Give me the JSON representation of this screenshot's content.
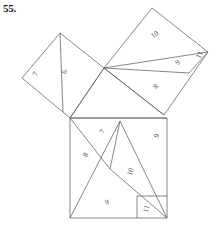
{
  "problem": {
    "number_label": "55."
  },
  "figure": {
    "type": "geometric-dissection-diagram",
    "stroke_color": "#5d5d63",
    "label_color": "#4a4a50",
    "background_color": "#ffffff"
  },
  "squares": {
    "left": {
      "name": "left-square",
      "pieces": [
        {
          "label": "7",
          "x": 36,
          "y": 74,
          "rotation": -65
        },
        {
          "label": "6",
          "x": 65,
          "y": 72,
          "rotation": -75
        }
      ]
    },
    "upper_right": {
      "name": "upper-right-square",
      "pieces": [
        {
          "label": "10",
          "x": 155,
          "y": 35,
          "rotation": -35
        },
        {
          "label": "9",
          "x": 178,
          "y": 63,
          "rotation": -40
        },
        {
          "label": "11",
          "x": 200,
          "y": 55,
          "rotation": -65
        },
        {
          "label": "8",
          "x": 156,
          "y": 87,
          "rotation": -40
        }
      ]
    },
    "bottom": {
      "name": "bottom-square",
      "pieces": [
        {
          "label": "7",
          "x": 103,
          "y": 132,
          "rotation": -55
        },
        {
          "label": "8",
          "x": 86,
          "y": 155,
          "rotation": -62
        },
        {
          "label": "9",
          "x": 157,
          "y": 136,
          "rotation": -62
        },
        {
          "label": "10",
          "x": 131,
          "y": 172,
          "rotation": -72
        },
        {
          "label": "9",
          "x": 107,
          "y": 203,
          "rotation": -12
        },
        {
          "label": "11",
          "x": 147,
          "y": 209,
          "rotation": -75
        }
      ]
    }
  },
  "geometry": {
    "central_triangle": {
      "name": "central-triangle",
      "vertices": [
        [
          104,
          68
        ],
        [
          70,
          118
        ],
        [
          139,
          118
        ]
      ]
    },
    "left_square_outline": [
      [
        70,
        118
      ],
      [
        22,
        78
      ],
      [
        60,
        33
      ],
      [
        104,
        68
      ]
    ],
    "upper_right_square_outline": [
      [
        104,
        68
      ],
      [
        152,
        8
      ],
      [
        208,
        52
      ],
      [
        164,
        115
      ]
    ],
    "bottom_square_outline": [
      [
        70,
        118
      ],
      [
        167,
        118
      ],
      [
        167,
        218
      ],
      [
        70,
        218
      ]
    ],
    "internal_cuts": [
      {
        "from": [
          60,
          33
        ],
        "to": [
          63,
          112
        ]
      },
      {
        "from": [
          104,
          68
        ],
        "to": [
          208,
          52
        ]
      },
      {
        "from": [
          104,
          68
        ],
        "to": [
          189,
          73
        ]
      },
      {
        "from": [
          189,
          73
        ],
        "to": [
          208,
          52
        ]
      },
      {
        "from": [
          70,
          118
        ],
        "to": [
          110,
          169
        ]
      },
      {
        "from": [
          110,
          169
        ],
        "to": [
          167,
          218
        ]
      },
      {
        "from": [
          110,
          169
        ],
        "to": [
          120,
          121
        ]
      },
      {
        "from": [
          120,
          121
        ],
        "to": [
          70,
          218
        ]
      },
      {
        "from": [
          120,
          121
        ],
        "to": [
          167,
          218
        ]
      },
      {
        "from": [
          137,
          196
        ],
        "to": [
          167,
          196
        ]
      },
      {
        "from": [
          137,
          196
        ],
        "to": [
          137,
          218
        ]
      }
    ]
  }
}
